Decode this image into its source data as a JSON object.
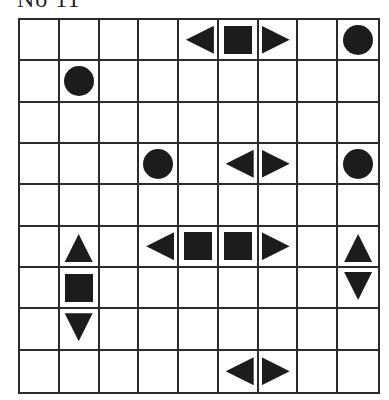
{
  "puzzle": {
    "title": "No 11",
    "rows": 9,
    "cols": 9,
    "colors": {
      "grid_line": "#2b2b2b",
      "piece_fill": "#1c1c1c",
      "background": "#ffffff"
    },
    "legend": {
      "circle": "single-cell ship (submarine)",
      "square": "ship middle segment",
      "left": "ship end pointing left",
      "right": "ship end pointing right",
      "up": "ship end pointing up",
      "down": "ship end pointing down"
    },
    "cells": [
      [
        "",
        "",
        "",
        "",
        "left",
        "square",
        "right",
        "",
        "circle"
      ],
      [
        "",
        "circle",
        "",
        "",
        "",
        "",
        "",
        "",
        ""
      ],
      [
        "",
        "",
        "",
        "",
        "",
        "",
        "",
        "",
        ""
      ],
      [
        "",
        "",
        "",
        "circle",
        "",
        "left",
        "right",
        "",
        "circle"
      ],
      [
        "",
        "",
        "",
        "",
        "",
        "",
        "",
        "",
        ""
      ],
      [
        "",
        "up",
        "",
        "left",
        "square",
        "square",
        "right",
        "",
        "up"
      ],
      [
        "",
        "square",
        "",
        "",
        "",
        "",
        "",
        "",
        "down"
      ],
      [
        "",
        "down",
        "",
        "",
        "",
        "",
        "",
        "",
        ""
      ],
      [
        "",
        "",
        "",
        "",
        "",
        "left",
        "right",
        "",
        ""
      ]
    ]
  }
}
